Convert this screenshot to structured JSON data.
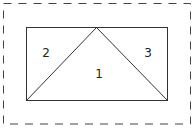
{
  "diagram": {
    "width": 196,
    "height": 130,
    "colors": {
      "background": "#ffffff",
      "stroke": "#333333",
      "dashed_stroke": "#444444",
      "text": "#222222"
    },
    "outer_boundary": {
      "style": "dashed",
      "x": 3.5,
      "y": 3.5,
      "width": 187,
      "height": 120.5,
      "dasharray": "8 7"
    },
    "inner_rectangle": {
      "x": 26.5,
      "y": 27.5,
      "width": 141,
      "height": 73
    },
    "triangle": {
      "points": [
        [
          26.5,
          100.5
        ],
        [
          96.5,
          27.5
        ],
        [
          167.5,
          100.5
        ]
      ]
    },
    "regions": [
      {
        "id": "1",
        "label": "1",
        "x": 99,
        "y": 78
      },
      {
        "id": "2",
        "label": "2",
        "x": 46,
        "y": 57
      },
      {
        "id": "3",
        "label": "3",
        "x": 148,
        "y": 57
      }
    ]
  }
}
